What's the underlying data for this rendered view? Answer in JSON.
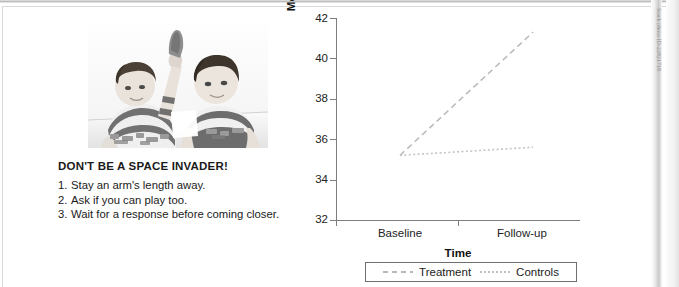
{
  "poster": {
    "title": "DON'T BE A SPACE INVADER!",
    "steps": [
      {
        "num": "1.",
        "text": "Stay an arm's length away."
      },
      {
        "num": "2.",
        "text": "Ask if you can play too."
      },
      {
        "num": "3.",
        "text": "Wait for a response before coming closer."
      }
    ],
    "photo_alt": "two-boys-playing-blocks-photo"
  },
  "credit": {
    "text": "Stock photo ID-22821718"
  },
  "chart_data": {
    "type": "line",
    "title": "",
    "xlabel": "Time",
    "ylabel": "Mean Social Skills Score",
    "categories": [
      "Baseline",
      "Follow-up"
    ],
    "xtick_labels": [
      "Baseline",
      "Follow-up"
    ],
    "ytick_labels": [
      "42",
      "40",
      "38",
      "36",
      "34",
      "32"
    ],
    "yticks": [
      42,
      40,
      38,
      36,
      34,
      32
    ],
    "ylim": [
      32,
      42
    ],
    "grid": false,
    "legend_position": "bottom",
    "series": [
      {
        "name": "Treatment",
        "values": [
          35.2,
          41.3
        ],
        "linestyle": "dashed",
        "color": "#bcbcbc"
      },
      {
        "name": "Controls",
        "values": [
          35.2,
          35.6
        ],
        "linestyle": "dotted",
        "color": "#c4c4c4"
      }
    ]
  },
  "legend": {
    "items": [
      {
        "label": "Treatment",
        "style": "dashed"
      },
      {
        "label": "Controls",
        "style": "dotted"
      }
    ]
  },
  "colors": {
    "axis": "#7d7d7d",
    "text": "#1a1a1a",
    "treatment": "#bcbcbc",
    "controls": "#c4c4c4"
  }
}
